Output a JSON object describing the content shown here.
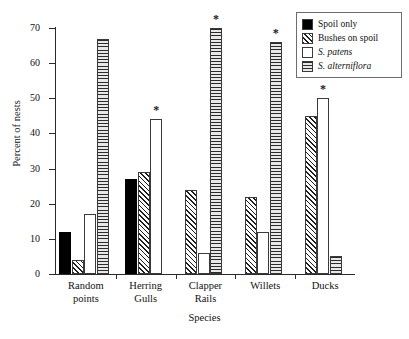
{
  "chart_data": {
    "type": "bar",
    "title": "",
    "xlabel": "Species",
    "ylabel": "Percent of nests",
    "categories": [
      "Random points",
      "Herring Gulls",
      "Clapper Rails",
      "Willets",
      "Ducks"
    ],
    "category_lines": [
      [
        "Random",
        "points"
      ],
      [
        "Herring",
        "Gulls"
      ],
      [
        "Clapper",
        "Rails"
      ],
      [
        "Willets"
      ],
      [
        "Ducks"
      ]
    ],
    "series": [
      {
        "name": "Spoil only",
        "pattern": "solid",
        "values": [
          12,
          27,
          null,
          null,
          null
        ]
      },
      {
        "name": "Bushes on spoil",
        "pattern": "hatch",
        "values": [
          4,
          29,
          24,
          22,
          45
        ]
      },
      {
        "name": "S. patens",
        "pattern": "empty",
        "values": [
          17,
          44,
          6,
          12,
          50
        ]
      },
      {
        "name": "S. alterniflora",
        "pattern": "hlines",
        "values": [
          67,
          null,
          70,
          66,
          5
        ]
      }
    ],
    "ylim": [
      0,
      70
    ],
    "yticks": [
      0,
      10,
      20,
      30,
      40,
      50,
      60,
      70
    ],
    "ytick_labels": [
      "0",
      "10",
      "20",
      "30",
      "40",
      "50",
      "60",
      "70"
    ],
    "grid": false,
    "legend_position": "top-right",
    "annotations": [
      {
        "symbol": "*",
        "category": "Herring Gulls",
        "series": "S. patens"
      },
      {
        "symbol": "*",
        "category": "Clapper Rails",
        "series": "S. alterniflora"
      },
      {
        "symbol": "*",
        "category": "Willets",
        "series": "S. alterniflora"
      },
      {
        "symbol": "*",
        "category": "Ducks",
        "series": "S. patens"
      }
    ]
  },
  "legend": {
    "items": [
      {
        "label": "Spoil only",
        "pattern": "solid",
        "italic": false
      },
      {
        "label": "Bushes on spoil",
        "pattern": "hatch",
        "italic": false
      },
      {
        "label": "S. patens",
        "pattern": "empty",
        "italic": true
      },
      {
        "label": "S. alterniflora",
        "pattern": "hlines",
        "italic": true
      }
    ]
  },
  "axes": {
    "y_title": "Percent of nests",
    "x_title": "Species"
  }
}
